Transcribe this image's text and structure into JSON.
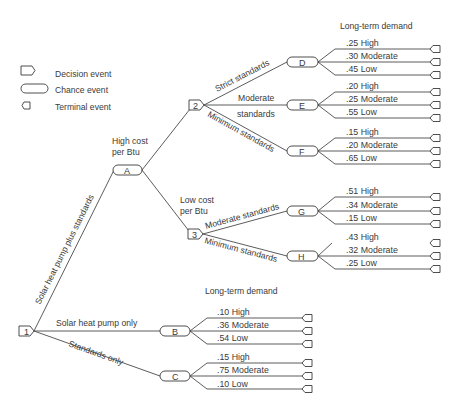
{
  "legend": {
    "items": [
      {
        "shape": "decision-icon",
        "label": "Decision event"
      },
      {
        "shape": "chance-icon",
        "label": "Chance event"
      },
      {
        "shape": "terminal-icon",
        "label": "Terminal event"
      }
    ]
  },
  "headers": {
    "top": "Long-term demand",
    "bottom": "Long-term demand"
  },
  "decision_nodes": [
    {
      "id": "1",
      "x": 19,
      "y": 331
    },
    {
      "id": "2",
      "x": 188,
      "y": 105
    },
    {
      "id": "3",
      "x": 188,
      "y": 234
    }
  ],
  "chance_nodes": [
    {
      "id": "A",
      "x": 113,
      "y": 170
    },
    {
      "id": "B",
      "x": 160,
      "y": 331
    },
    {
      "id": "C",
      "x": 160,
      "y": 376
    },
    {
      "id": "D",
      "x": 287,
      "y": 62
    },
    {
      "id": "E",
      "x": 287,
      "y": 105
    },
    {
      "id": "F",
      "x": 287,
      "y": 151
    },
    {
      "id": "G",
      "x": 287,
      "y": 211
    },
    {
      "id": "H",
      "x": 287,
      "y": 256
    }
  ],
  "branch_labels": {
    "solar_plus_standards": "Solar heat pump plus standards",
    "solar_only": "Solar heat pump only",
    "standards_only": "Standards only",
    "high_cost_1": "High cost",
    "high_cost_2": "per Btu",
    "low_cost_1": "Low cost",
    "low_cost_2": "per Btu",
    "strict": "Strict standards",
    "moderate_1": "Moderate",
    "moderate_2": "standards",
    "minimum_2": "Minimum standards",
    "moderate_3": "Moderate standards",
    "minimum_3": "Minimum standards"
  },
  "outcomes": {
    "D": [
      ".25 High",
      ".30 Moderate",
      ".45 Low"
    ],
    "E": [
      ".20 High",
      ".25 Moderate",
      ".55 Low"
    ],
    "F": [
      ".15 High",
      ".20 Moderate",
      ".65 Low"
    ],
    "G": [
      ".51 High",
      ".34 Moderate",
      ".15 Low"
    ],
    "H": [
      ".43 High",
      ".32 Moderate",
      ".25 Low"
    ],
    "B": [
      ".10 High",
      ".36 Moderate",
      ".54 Low"
    ],
    "C": [
      ".15 High",
      ".75 Moderate",
      ".10 Low"
    ]
  }
}
